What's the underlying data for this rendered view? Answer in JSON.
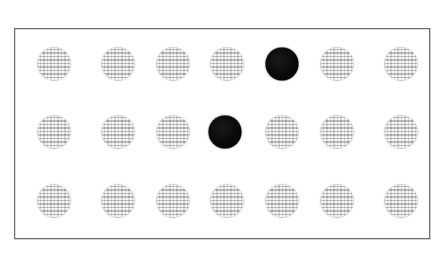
{
  "figure": {
    "background_color": "#ffffff",
    "panel": {
      "name": "stimulus-panel",
      "border_color": "#6e6e6e",
      "fill_color": "#ffffff",
      "x": 14,
      "y": 28,
      "width": 416,
      "height": 211
    },
    "grid": {
      "rows": 3,
      "columns": 7,
      "item_diameter": 33,
      "column_centers_x": [
        53,
        117,
        181,
        224,
        281,
        336,
        400
      ],
      "row_centers_y": [
        63,
        131,
        200
      ],
      "column_spacing": 54,
      "row_spacing": 68
    },
    "colors": {
      "distractor_gray": "#cccccc",
      "target_black": "#0a0a0a",
      "panel_border": "#6e6e6e",
      "page_background": "#ffffff"
    },
    "legend_counts": {
      "total_items": 21,
      "distractor_count": 19,
      "target_count": 2
    }
  },
  "chart_data": {
    "type": "scatter",
    "xlabel": "",
    "ylabel": "",
    "xlim": [
      0,
      416
    ],
    "ylim": [
      0,
      211
    ],
    "grid": false,
    "legend_position": "none",
    "categories": [
      "distractor",
      "target"
    ],
    "series": [
      {
        "name": "distractor",
        "color": "#cccccc",
        "marker": "circle",
        "marker_size": 33,
        "points": [
          {
            "row": 0,
            "col": 0,
            "cx": 53,
            "cy": 63
          },
          {
            "row": 0,
            "col": 1,
            "cx": 117,
            "cy": 63
          },
          {
            "row": 0,
            "col": 2,
            "cx": 172,
            "cy": 63
          },
          {
            "row": 0,
            "col": 3,
            "cx": 226,
            "cy": 63
          },
          {
            "row": 0,
            "col": 5,
            "cx": 336,
            "cy": 63
          },
          {
            "row": 0,
            "col": 6,
            "cx": 400,
            "cy": 63
          },
          {
            "row": 1,
            "col": 0,
            "cx": 53,
            "cy": 131
          },
          {
            "row": 1,
            "col": 1,
            "cx": 117,
            "cy": 131
          },
          {
            "row": 1,
            "col": 2,
            "cx": 172,
            "cy": 131
          },
          {
            "row": 1,
            "col": 4,
            "cx": 281,
            "cy": 131
          },
          {
            "row": 1,
            "col": 5,
            "cx": 336,
            "cy": 131
          },
          {
            "row": 1,
            "col": 6,
            "cx": 400,
            "cy": 131
          },
          {
            "row": 2,
            "col": 0,
            "cx": 53,
            "cy": 200
          },
          {
            "row": 2,
            "col": 1,
            "cx": 117,
            "cy": 200
          },
          {
            "row": 2,
            "col": 2,
            "cx": 172,
            "cy": 200
          },
          {
            "row": 2,
            "col": 3,
            "cx": 226,
            "cy": 200
          },
          {
            "row": 2,
            "col": 4,
            "cx": 281,
            "cy": 200
          },
          {
            "row": 2,
            "col": 5,
            "cx": 336,
            "cy": 200
          },
          {
            "row": 2,
            "col": 6,
            "cx": 400,
            "cy": 200
          }
        ]
      },
      {
        "name": "target",
        "color": "#0a0a0a",
        "marker": "circle",
        "marker_size": 33,
        "points": [
          {
            "row": 0,
            "col": 4,
            "cx": 281,
            "cy": 63
          },
          {
            "row": 1,
            "col": 3,
            "cx": 224,
            "cy": 131
          }
        ]
      }
    ]
  }
}
